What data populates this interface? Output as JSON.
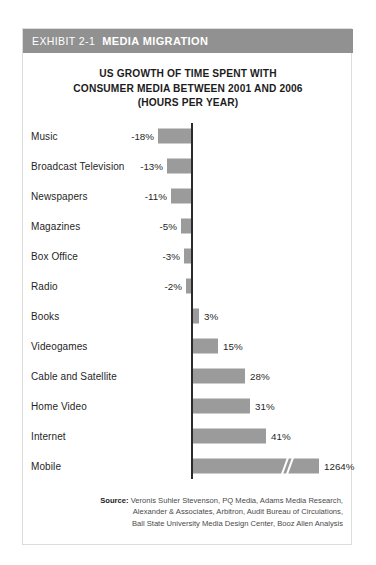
{
  "exhibit": {
    "number": "EXHIBIT 2-1",
    "title": "MEDIA MIGRATION"
  },
  "chart_data": {
    "type": "bar",
    "orientation": "horizontal",
    "title": "US GROWTH OF TIME SPENT WITH CONSUMER MEDIA BETWEEN 2001 AND 2006 (HOURS PER YEAR)",
    "title_lines": [
      "US GROWTH OF TIME SPENT WITH",
      "CONSUMER MEDIA BETWEEN 2001 AND 2006",
      "(HOURS PER YEAR)"
    ],
    "xlabel": "",
    "ylabel": "",
    "grid": false,
    "legend": false,
    "bar_color": "#9b9b9b",
    "axis_color": "#2b2b2b",
    "categories": [
      "Music",
      "Broadcast Television",
      "Newspapers",
      "Magazines",
      "Box Office",
      "Radio",
      "Books",
      "Videogames",
      "Cable and Satellite",
      "Home Video",
      "Internet",
      "Mobile"
    ],
    "values": [
      -18,
      -13,
      -11,
      -5,
      -3,
      -2,
      3,
      15,
      28,
      31,
      41,
      1264
    ],
    "value_labels": [
      "-18%",
      "-13%",
      "-11%",
      "-5%",
      "-3%",
      "-2%",
      "3%",
      "15%",
      "28%",
      "31%",
      "41%",
      "1264%"
    ],
    "axis_break": {
      "present": true,
      "category": "Mobile",
      "note": "bar truncated with diagonal break mark"
    },
    "bars": [
      {
        "label": "Music",
        "value": -18,
        "text": "-18%",
        "left": 135,
        "width": 33,
        "neg": true
      },
      {
        "label": "Broadcast Television",
        "value": -13,
        "text": "-13%",
        "left": 144,
        "width": 24,
        "neg": true
      },
      {
        "label": "Newspapers",
        "value": -11,
        "text": "-11%",
        "left": 148,
        "width": 20,
        "neg": true
      },
      {
        "label": "Magazines",
        "value": -5,
        "text": "-5%",
        "left": 158,
        "width": 10,
        "neg": true
      },
      {
        "label": "Box Office",
        "value": -3,
        "text": "-3%",
        "left": 161,
        "width": 7,
        "neg": true
      },
      {
        "label": "Radio",
        "value": -2,
        "text": "-2%",
        "left": 163,
        "width": 5,
        "neg": true
      },
      {
        "label": "Books",
        "value": 3,
        "text": "3%",
        "left": 170,
        "width": 6,
        "neg": false
      },
      {
        "label": "Videogames",
        "value": 15,
        "text": "15%",
        "left": 170,
        "width": 25,
        "neg": false
      },
      {
        "label": "Cable and Satellite",
        "value": 28,
        "text": "28%",
        "left": 170,
        "width": 52,
        "neg": false
      },
      {
        "label": "Home Video",
        "value": 31,
        "text": "31%",
        "left": 170,
        "width": 57,
        "neg": false
      },
      {
        "label": "Internet",
        "value": 41,
        "text": "41%",
        "left": 170,
        "width": 73,
        "neg": false
      },
      {
        "label": "Mobile",
        "value": 1264,
        "text": "1264%",
        "left": 170,
        "width": 126,
        "neg": false
      }
    ]
  },
  "source": {
    "label": "Source:",
    "lines": [
      "Veronis Suhler Stevenson, PQ Media, Adams Media Research,",
      "Alexander & Associates, Arbitron, Audit Bureau of Circulations,",
      "Ball State University Media Design Center, Booz Allen Analysis"
    ]
  }
}
